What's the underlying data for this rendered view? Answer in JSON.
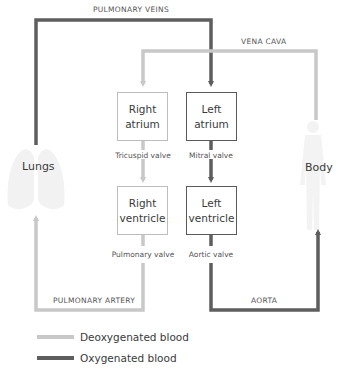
{
  "diagram": {
    "title": "",
    "colors": {
      "deoxygenated": "#c8c8c8",
      "oxygenated": "#5e5e5e",
      "box_border_light": "#bdbdbd",
      "box_border_dark": "#5a5a5a",
      "silhouette": "#f1f1f1"
    },
    "vessels": {
      "pulmonary_veins": "PULMONARY VEINS",
      "vena_cava": "VENA CAVA",
      "pulmonary_artery": "PULMONARY ARTERY",
      "aorta": "AORTA"
    },
    "chambers": {
      "right_atrium": {
        "line1": "Right",
        "line2": "atrium"
      },
      "left_atrium": {
        "line1": "Left",
        "line2": "atrium"
      },
      "right_ventricle": {
        "line1": "Right",
        "line2": "ventricle"
      },
      "left_ventricle": {
        "line1": "Left",
        "line2": "ventricle"
      }
    },
    "valves": {
      "tricuspid": "Tricuspid valve",
      "mitral": "Mitral valve",
      "pulmonary": "Pulmonary valve",
      "aortic": "Aortic valve"
    },
    "organs": {
      "lungs": "Lungs",
      "body": "Body"
    },
    "legend": [
      {
        "label": "Deoxygenated blood",
        "color": "#c8c8c8"
      },
      {
        "label": "Oxygenated blood",
        "color": "#5e5e5e"
      }
    ]
  }
}
